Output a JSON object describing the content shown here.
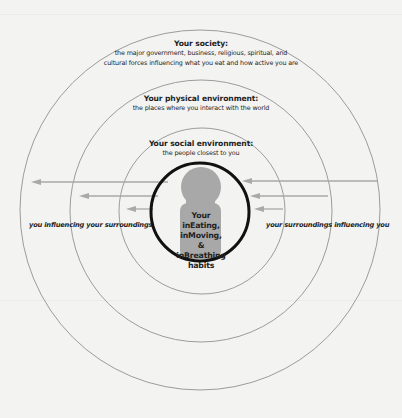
{
  "diagram": {
    "type": "concentric-circles",
    "colors": {
      "background": "#f3f3f2",
      "ring_stroke": "#9c9c9c",
      "arrow": "#a9a9a9",
      "inner_ring": "#111111",
      "figure_fill": "#a8a8a8",
      "text": "#1e1e1e"
    },
    "rings": [
      {
        "id": "society",
        "title": "Your society:",
        "description_lines": [
          "the major government, business, religious, spiritual, and",
          "cultural forces influencing what you eat and how active you are"
        ]
      },
      {
        "id": "physical",
        "title": "Your physical environment:",
        "description_lines": [
          "the places where you interact with the world"
        ]
      },
      {
        "id": "social",
        "title": "Your social environment:",
        "description_lines": [
          "the people closest to you"
        ]
      }
    ],
    "center": {
      "lines": [
        "Your",
        "inEating,",
        "inMoving, &",
        "inBreathing",
        "habits"
      ],
      "icon": "person-icon"
    },
    "left_label": "you influencing your surroundings",
    "right_label": "your surroundings influencing you",
    "arrows": {
      "outward_count": 3,
      "inward_count": 3
    }
  }
}
